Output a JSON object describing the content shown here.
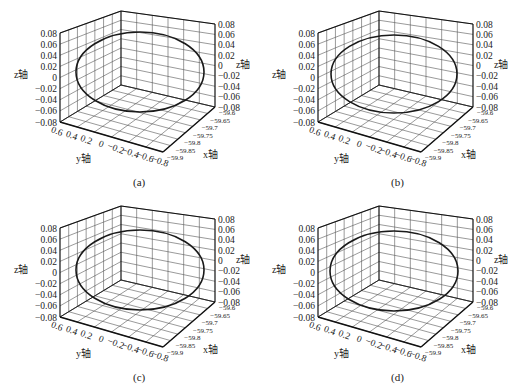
{
  "figure": {
    "panels": [
      {
        "id": "a",
        "caption": "(a)",
        "offset": [
          0,
          0
        ],
        "circle": {
          "cx": 140,
          "cy": 72,
          "rx": 64,
          "ry": 40
        }
      },
      {
        "id": "b",
        "caption": "(b)",
        "offset": [
          258,
          0
        ],
        "circle": {
          "cx": 136,
          "cy": 74,
          "rx": 63,
          "ry": 39
        }
      },
      {
        "id": "c",
        "caption": "(c)",
        "offset": [
          0,
          195
        ],
        "circle": {
          "cx": 140,
          "cy": 75,
          "rx": 64,
          "ry": 40
        }
      },
      {
        "id": "d",
        "caption": "(d)",
        "offset": [
          258,
          195
        ],
        "circle": {
          "cx": 136,
          "cy": 76,
          "rx": 64,
          "ry": 40
        }
      }
    ],
    "axes": {
      "z_label": "z轴",
      "y_label": "y轴",
      "x_label": "x轴",
      "z_ticks": [
        "0.08",
        "0.06",
        "0.04",
        "0.02",
        "0",
        "−0.02",
        "−0.04",
        "−0.06",
        "−0.08"
      ],
      "y_ticks": [
        "0.6",
        "0.4",
        "0.2",
        "0",
        "−0.2",
        "−0.4",
        "−0.6",
        "−0.8"
      ],
      "x_ticks": [
        "−59.6",
        "−59.65",
        "−59.7",
        "−59.75",
        "−59.8",
        "−59.85",
        "−59.9"
      ]
    },
    "colors": {
      "curve": "#1a1a1a",
      "grid": "#555555",
      "box": "#111111",
      "text": "#222222"
    }
  },
  "chart_data": [
    {
      "type": "scatter",
      "subtype": "3d-line",
      "title": "(a)",
      "xlabel": "x轴",
      "ylabel": "y轴",
      "zlabel": "z轴",
      "xlim": [
        -59.9,
        -59.6
      ],
      "ylim": [
        -0.8,
        0.6
      ],
      "zlim": [
        -0.08,
        0.08
      ],
      "grid": true,
      "series": [
        {
          "name": "trajectory",
          "shape": "closed circle in x-z plane",
          "x_center": -59.75,
          "z_center": 0,
          "z_amplitude": 0.07,
          "x_amplitude": 0.15
        }
      ]
    },
    {
      "type": "scatter",
      "subtype": "3d-line",
      "title": "(b)",
      "xlabel": "x轴",
      "ylabel": "y轴",
      "zlabel": "z轴",
      "xlim": [
        -59.9,
        -59.6
      ],
      "ylim": [
        -0.8,
        0.6
      ],
      "zlim": [
        -0.08,
        0.08
      ],
      "grid": true,
      "series": [
        {
          "name": "trajectory",
          "shape": "closed circle in x-z plane",
          "x_center": -59.75,
          "z_center": 0,
          "z_amplitude": 0.07,
          "x_amplitude": 0.15
        }
      ]
    },
    {
      "type": "scatter",
      "subtype": "3d-line",
      "title": "(c)",
      "xlabel": "x轴",
      "ylabel": "y轴",
      "zlabel": "z轴",
      "xlim": [
        -59.9,
        -59.6
      ],
      "ylim": [
        -0.8,
        0.6
      ],
      "zlim": [
        -0.08,
        0.08
      ],
      "grid": true,
      "series": [
        {
          "name": "trajectory",
          "shape": "closed circle in x-z plane",
          "x_center": -59.75,
          "z_center": 0,
          "z_amplitude": 0.07,
          "x_amplitude": 0.15
        }
      ]
    },
    {
      "type": "scatter",
      "subtype": "3d-line",
      "title": "(d)",
      "xlabel": "x轴",
      "ylabel": "y轴",
      "zlabel": "z轴",
      "xlim": [
        -59.9,
        -59.6
      ],
      "ylim": [
        -0.8,
        0.6
      ],
      "zlim": [
        -0.08,
        0.08
      ],
      "grid": true,
      "series": [
        {
          "name": "trajectory",
          "shape": "closed circle in x-z plane",
          "x_center": -59.75,
          "z_center": 0,
          "z_amplitude": 0.07,
          "x_amplitude": 0.15
        }
      ]
    }
  ]
}
